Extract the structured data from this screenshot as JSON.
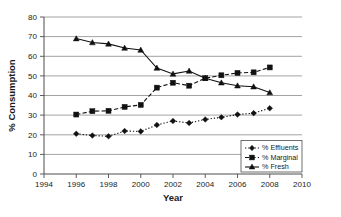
{
  "chart_data": {
    "type": "line",
    "title": "",
    "subtitle": "",
    "xlabel": "Year",
    "ylabel": "% Consumption",
    "xlim": [
      1994,
      2010
    ],
    "ylim": [
      0,
      80
    ],
    "xticks": [
      1994,
      1996,
      1998,
      2000,
      2002,
      2004,
      2006,
      2008,
      2010
    ],
    "yticks": [
      0,
      10,
      20,
      30,
      40,
      50,
      60,
      70,
      80
    ],
    "grid": "horizontal",
    "legend_position": "bottom-right",
    "x": [
      1996,
      1997,
      1998,
      1999,
      2000,
      2001,
      2002,
      2003,
      2004,
      2005,
      2006,
      2007,
      2008
    ],
    "series": [
      {
        "name": "% Effluents",
        "marker": "diamond",
        "linestyle": "dotted",
        "color": "#111111",
        "values": [
          20.5,
          19.6,
          19.2,
          21.9,
          21.7,
          25.0,
          27.0,
          26.0,
          27.8,
          28.9,
          30.3,
          31.0,
          33.5
        ]
      },
      {
        "name": "% Marginal",
        "marker": "square",
        "linestyle": "dashed",
        "color": "#111111",
        "values": [
          30.3,
          32.0,
          32.2,
          34.2,
          35.2,
          44.0,
          46.5,
          45.0,
          48.8,
          50.3,
          51.5,
          51.8,
          54.3
        ]
      },
      {
        "name": "% Fresh",
        "marker": "triangle",
        "linestyle": "solid",
        "color": "#111111",
        "values": [
          69.0,
          67.0,
          66.3,
          64.2,
          63.2,
          54.0,
          51.0,
          52.5,
          48.8,
          46.5,
          45.0,
          44.5,
          41.5
        ]
      }
    ]
  },
  "axes": {
    "y_title": "% Consumption",
    "x_title": "Year",
    "y_tick_labels": [
      "0",
      "10",
      "20",
      "30",
      "40",
      "50",
      "60",
      "70",
      "80"
    ],
    "x_tick_labels": [
      "1994",
      "1996",
      "1998",
      "2000",
      "2002",
      "2004",
      "2006",
      "2008",
      "2010"
    ]
  },
  "legend": {
    "entries": [
      {
        "label": "% Effluents"
      },
      {
        "label": "% Marginal"
      },
      {
        "label": "% Fresh"
      }
    ]
  }
}
